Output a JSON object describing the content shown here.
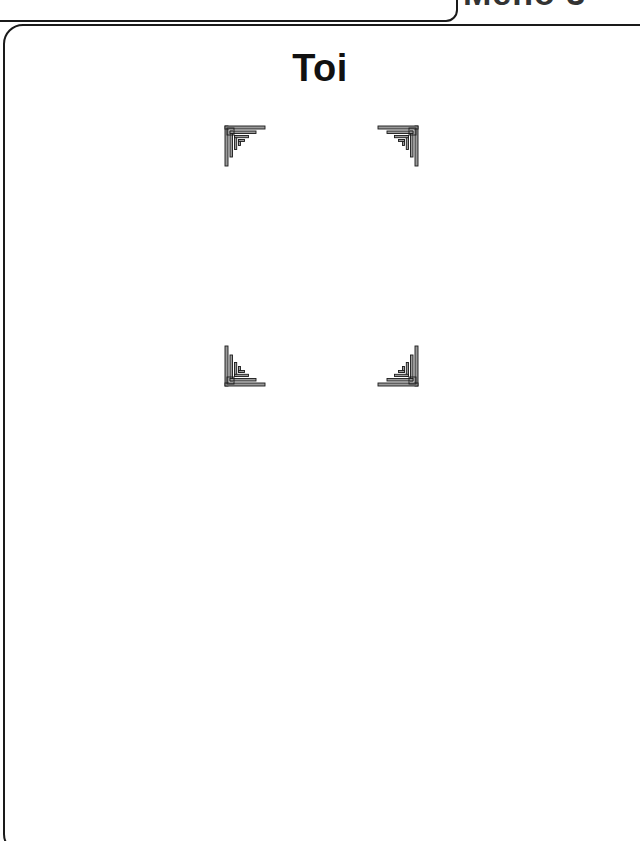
{
  "header": {
    "partial_label": "Meno 3"
  },
  "card": {
    "title": "Toi",
    "frame": {
      "corners": [
        "corner-ornament-top-left",
        "corner-ornament-top-right",
        "corner-ornament-bottom-left",
        "corner-ornament-bottom-right"
      ]
    }
  },
  "colors": {
    "ink": "#1a1a1a",
    "ornament_fill": "#9a9a9a",
    "background": "#ffffff"
  }
}
